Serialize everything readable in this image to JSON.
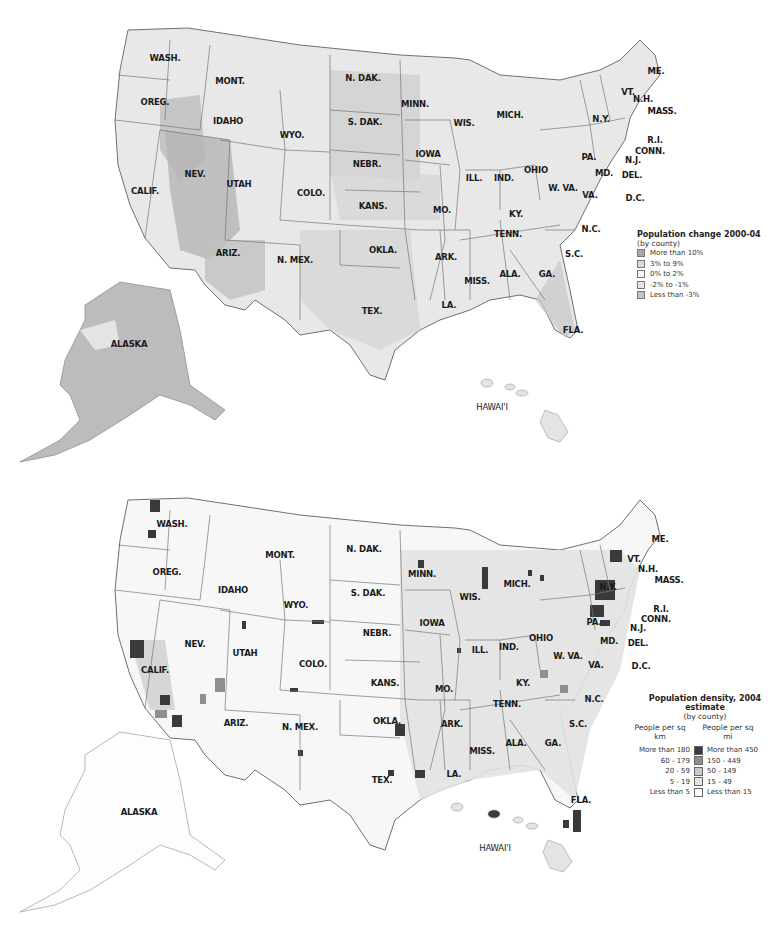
{
  "maps": {
    "top": {
      "title": "Population change 2000-04",
      "subtitle": "(by county)",
      "legend": [
        {
          "label": "More than 10%",
          "color": "#a8a8a8"
        },
        {
          "label": "3% to 9%",
          "color": "#dadada"
        },
        {
          "label": "0% to 2%",
          "color": "#f6f6f6"
        },
        {
          "label": "-2% to -1%",
          "color": "#e4e4e4"
        },
        {
          "label": "Less than -3%",
          "color": "#c4c4c4"
        }
      ]
    },
    "bottom": {
      "title": "Population density, 2004 estimate",
      "subtitle": "(by county)",
      "col_left": "People per sq km",
      "col_right": "People per sq mi",
      "legend": [
        {
          "km": "More than 180",
          "mi": "More than 450",
          "color": "#3a3a3a"
        },
        {
          "km": "60 - 179",
          "mi": "150 - 449",
          "color": "#8f8f8f"
        },
        {
          "km": "20 - 59",
          "mi": "50 - 149",
          "color": "#c8c8c8"
        },
        {
          "km": "5 - 19",
          "mi": "15 - 49",
          "color": "#e6e6e6"
        },
        {
          "km": "Less than 5",
          "mi": "Less than 15",
          "color": "#ffffff"
        }
      ]
    }
  },
  "state_labels": {
    "WA": "WASH.",
    "OR": "OREG.",
    "CA": "CALIF.",
    "ID": "IDAHO",
    "NV": "NEV.",
    "MT": "MONT.",
    "WY": "WYO.",
    "UT": "UTAH",
    "AZ": "ARIZ.",
    "CO": "COLO.",
    "NM": "N. MEX.",
    "ND": "N. DAK.",
    "SD": "S. DAK.",
    "NE": "NEBR.",
    "KS": "KANS.",
    "OK": "OKLA.",
    "TX": "TEX.",
    "MN": "MINN.",
    "IA": "IOWA",
    "MO": "MO.",
    "AR": "ARK.",
    "LA": "LA.",
    "WI": "WIS.",
    "IL": "ILL.",
    "MI": "MICH.",
    "IN": "IND.",
    "OH": "OHIO",
    "KY": "KY.",
    "TN": "TENN.",
    "MS": "MISS.",
    "AL": "ALA.",
    "GA": "GA.",
    "FL": "FLA.",
    "SC": "S.C.",
    "NC": "N.C.",
    "VA": "VA.",
    "WV": "W. VA.",
    "PA": "PA.",
    "NY": "N.Y.",
    "MD": "MD.",
    "DE": "DEL.",
    "DC": "D.C.",
    "NJ": "N.J.",
    "CT": "CONN.",
    "RI": "R.I.",
    "MA": "MASS.",
    "VT": "VT.",
    "NH": "N.H.",
    "ME": "ME.",
    "AK": "ALASKA",
    "HI": "HAWAI'I"
  },
  "colors": {
    "border": "#6a6a6a",
    "land": "#ececec"
  }
}
